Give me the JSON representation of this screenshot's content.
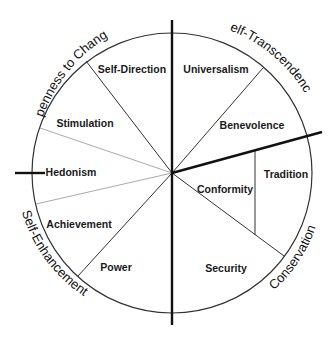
{
  "diagram": {
    "type": "circular value model",
    "center": [
      172,
      173
    ],
    "radius": 140,
    "values": [
      {
        "label": "Self-Direction",
        "x": 132,
        "y": 73
      },
      {
        "label": "Universalism",
        "x": 216,
        "y": 73
      },
      {
        "label": "Stimulation",
        "x": 85,
        "y": 127
      },
      {
        "label": "Benevolence",
        "x": 252,
        "y": 129
      },
      {
        "label": "Hedonism",
        "x": 71,
        "y": 176
      },
      {
        "label": "Tradition",
        "x": 286,
        "y": 178
      },
      {
        "label": "Conformity",
        "x": 225,
        "y": 193
      },
      {
        "label": "Achievement",
        "x": 79,
        "y": 228
      },
      {
        "label": "Power",
        "x": 116,
        "y": 271
      },
      {
        "label": "Security",
        "x": 226,
        "y": 272
      }
    ],
    "higher_order": [
      {
        "label": "Openness to Change",
        "id": "openness"
      },
      {
        "label": "Self-Transcendence",
        "id": "transcendence"
      },
      {
        "label": "Self-Enhancement",
        "id": "enhancement"
      },
      {
        "label": "Conservation",
        "id": "conservation"
      }
    ],
    "colors": {
      "line": "#222222",
      "light_line": "#aaaaaa",
      "text": "#1a1a1a"
    }
  }
}
